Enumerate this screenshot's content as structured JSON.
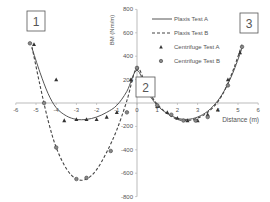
{
  "chart_data": {
    "type": "line",
    "title": "",
    "xlabel": "Distance (m)",
    "ylabel": "BM (Nm/m)",
    "xlim": [
      -6,
      6
    ],
    "ylim": [
      -800,
      800
    ],
    "x_ticks": [
      "-6",
      "-5",
      "-4",
      "-3",
      "-2",
      "-1",
      "0",
      "1",
      "2",
      "3",
      "4",
      "5",
      "6"
    ],
    "y_ticks": [
      "800",
      "600",
      "400",
      "200",
      "0",
      "-200",
      "-400",
      "-600",
      "-800"
    ],
    "grid": false,
    "legend_position": "upper right",
    "annotations": [
      "1",
      "2",
      "3"
    ],
    "series": [
      {
        "name": "Plaxis Test A",
        "style": "solid",
        "x": [
          -5.2,
          -4.8,
          -4.4,
          -4.0,
          -3.5,
          -3.0,
          -2.5,
          -2.0,
          -1.5,
          -1.0,
          -0.5,
          0.0,
          0.5,
          1.0,
          1.5,
          2.0,
          2.5,
          3.0,
          3.5,
          4.0,
          4.4,
          4.8,
          5.2
        ],
        "y": [
          470,
          260,
          80,
          -40,
          -110,
          -140,
          -140,
          -120,
          -80,
          -20,
          100,
          280,
          100,
          -20,
          -90,
          -130,
          -140,
          -120,
          -70,
          20,
          130,
          280,
          470
        ]
      },
      {
        "name": "Plaxis Test B",
        "style": "dashed",
        "x": [
          -5.2,
          -4.8,
          -4.4,
          -4.0,
          -3.5,
          -3.0,
          -2.5,
          -2.0,
          -1.5,
          -1.0,
          -0.5,
          0.0,
          0.5,
          1.0,
          1.5,
          2.0,
          2.5,
          3.0,
          3.5,
          4.0,
          4.4,
          4.8,
          5.2
        ],
        "y": [
          480,
          150,
          -150,
          -380,
          -560,
          -650,
          -650,
          -570,
          -420,
          -230,
          20,
          300,
          120,
          -10,
          -90,
          -140,
          -150,
          -130,
          -80,
          10,
          130,
          300,
          500
        ]
      },
      {
        "name": "Centrifuge Test A",
        "style": "triangle",
        "x": [
          -5.1,
          -4.0,
          -3.6,
          -3.0,
          -2.5,
          -2.0,
          -1.5,
          -1.0,
          -0.3,
          0.0,
          0.5,
          1.0,
          1.5,
          2.0,
          2.5,
          3.0,
          3.5,
          4.0,
          4.5,
          5.1
        ],
        "y": [
          500,
          200,
          -150,
          -140,
          -140,
          -140,
          -120,
          -80,
          200,
          300,
          150,
          -30,
          -80,
          -130,
          -150,
          -150,
          -100,
          -60,
          200,
          430
        ]
      },
      {
        "name": "Centrifuge Test B",
        "style": "circle",
        "x": [
          -5.3,
          -4.6,
          -4.0,
          -3.0,
          -2.5,
          -1.3,
          -0.5,
          0.0,
          1.0,
          1.7,
          2.3,
          2.9,
          3.5,
          4.5,
          5.2
        ],
        "y": [
          510,
          0,
          -380,
          -650,
          -640,
          -410,
          -80,
          300,
          -20,
          -100,
          -150,
          -150,
          -120,
          150,
          480
        ]
      }
    ]
  }
}
